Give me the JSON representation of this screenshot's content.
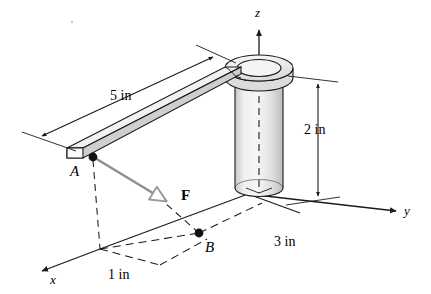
{
  "figure": {
    "background_color": "#ffffff",
    "line_color": "#1a1a1a",
    "force_color": "#8a8a8a",
    "body_fill_top": "#f2f2f2",
    "body_fill_side": "#d9d9d9",
    "cylinder_fill": "#e8e8e8"
  },
  "axes": {
    "z": {
      "label": "z"
    },
    "y": {
      "label": "y"
    },
    "x": {
      "label": "x"
    }
  },
  "points": {
    "A": {
      "label": "A"
    },
    "B": {
      "label": "B"
    }
  },
  "force": {
    "label": "F"
  },
  "dimensions": {
    "arm_length": {
      "value": "5 in"
    },
    "post_height": {
      "value": "2 in"
    },
    "y_offset": {
      "value": "3 in"
    },
    "x_offset": {
      "value": "1 in"
    }
  }
}
